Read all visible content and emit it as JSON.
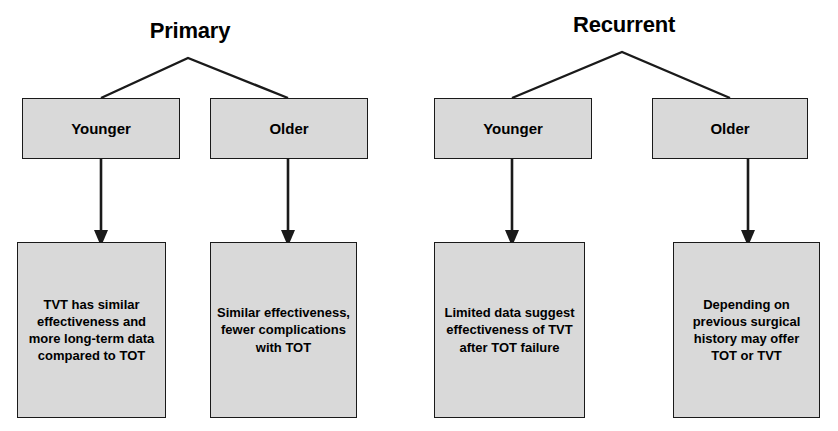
{
  "diagram": {
    "type": "flowchart",
    "orientation": "top-down",
    "box_fill_color": "#d9d9d9",
    "box_border_color": "#1a1a1a",
    "text_color": "#000000",
    "groups": [
      {
        "title": "Primary",
        "branches": [
          {
            "label": "Younger",
            "recommendation": "TVT has similar effectiveness and more long-term data compared to TOT"
          },
          {
            "label": "Older",
            "recommendation": "Similar effectiveness, fewer complications with TOT"
          }
        ]
      },
      {
        "title": "Recurrent",
        "branches": [
          {
            "label": "Younger",
            "recommendation": "Limited data suggest effectiveness of TVT after TOT failure"
          },
          {
            "label": "Older",
            "recommendation": "Depending on previous surgical history may offer TOT or TVT"
          }
        ]
      }
    ]
  }
}
